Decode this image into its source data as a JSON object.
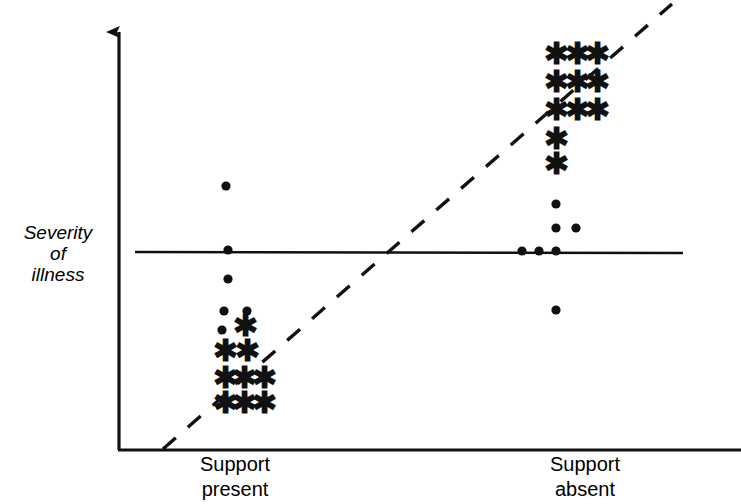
{
  "chart_data": {
    "type": "scatter",
    "title": "",
    "subtitle": "",
    "xlabel": "",
    "ylabel": "Severity of illness",
    "ylabel_lines": [
      "Severity",
      "of",
      "illness"
    ],
    "categories": [
      "Support present",
      "Support absent"
    ],
    "xtick_labels": [
      {
        "line1": "Support",
        "line2": "present"
      },
      {
        "line1": "Support",
        "line2": "absent"
      }
    ],
    "grid": false,
    "legend": null,
    "axis_ticks": [],
    "axis_color": "#111111",
    "marker_color": "#111111",
    "annotations": [
      {
        "name": "mean-reference-line",
        "style": "solid",
        "orientation": "horizontal",
        "x1": 135,
        "y1": 252,
        "x2": 683,
        "y2": 253
      },
      {
        "name": "trend-line",
        "style": "dashed",
        "orientation": "diagonal",
        "x1": 163,
        "y1": 449,
        "x2": 672,
        "y2": 4
      }
    ],
    "axes": {
      "y_axis": {
        "x": 119,
        "y_top": 26,
        "y_bottom": 450,
        "arrow": true
      },
      "x_axis": {
        "y": 450,
        "x_left": 119,
        "x_right": 741,
        "arrow": false
      }
    },
    "series": [
      {
        "name": "Support present",
        "group": "left",
        "marker_groups": [
          {
            "marker": "dot",
            "points": [
              {
                "x": 226,
                "y": 186
              },
              {
                "x": 228,
                "y": 250
              },
              {
                "x": 228,
                "y": 279
              },
              {
                "x": 224,
                "y": 311
              },
              {
                "x": 247,
                "y": 311
              },
              {
                "x": 222,
                "y": 330
              }
            ]
          },
          {
            "marker": "asterisk",
            "points": [
              {
                "x": 245,
                "y": 329
              },
              {
                "x": 225,
                "y": 354
              },
              {
                "x": 247,
                "y": 354
              },
              {
                "x": 225,
                "y": 381
              },
              {
                "x": 244,
                "y": 381
              },
              {
                "x": 264,
                "y": 381
              },
              {
                "x": 225,
                "y": 406
              },
              {
                "x": 244,
                "y": 406
              },
              {
                "x": 264,
                "y": 406
              }
            ]
          }
        ]
      },
      {
        "name": "Support absent",
        "group": "right",
        "marker_groups": [
          {
            "marker": "asterisk",
            "points": [
              {
                "x": 556,
                "y": 57
              },
              {
                "x": 577,
                "y": 57
              },
              {
                "x": 597,
                "y": 57
              },
              {
                "x": 556,
                "y": 85
              },
              {
                "x": 577,
                "y": 85
              },
              {
                "x": 597,
                "y": 85
              },
              {
                "x": 556,
                "y": 113
              },
              {
                "x": 577,
                "y": 113
              },
              {
                "x": 597,
                "y": 113
              },
              {
                "x": 556,
                "y": 142
              },
              {
                "x": 556,
                "y": 167
              }
            ]
          },
          {
            "marker": "dot",
            "points": [
              {
                "x": 556,
                "y": 204
              },
              {
                "x": 556,
                "y": 228
              },
              {
                "x": 576,
                "y": 228
              },
              {
                "x": 522,
                "y": 251
              },
              {
                "x": 539,
                "y": 251
              },
              {
                "x": 556,
                "y": 251
              },
              {
                "x": 556,
                "y": 310
              }
            ]
          }
        ]
      }
    ]
  }
}
